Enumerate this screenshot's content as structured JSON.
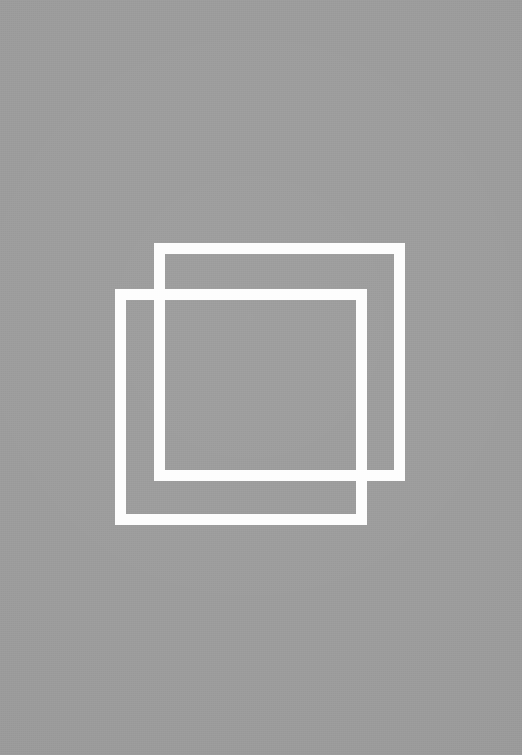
{
  "canvas": {
    "width": 522,
    "height": 755,
    "background_color": "#9b9b9b",
    "description": "Two overlapping white square outlines on a flat medium-gray field"
  },
  "palette": {
    "background_gray": "#9b9b9b",
    "stroke_white": "#fdfdfd"
  },
  "shapes": [
    {
      "id": "back-square",
      "name": "upper-right square outline",
      "stroke_color": "#fdfdfd",
      "stroke_width": 11,
      "x": 154,
      "y": 243,
      "width": 251,
      "height": 238
    },
    {
      "id": "front-square",
      "name": "lower-left square outline",
      "stroke_color": "#fdfdfd",
      "stroke_width": 11,
      "x": 115,
      "y": 289,
      "width": 252,
      "height": 236
    }
  ]
}
